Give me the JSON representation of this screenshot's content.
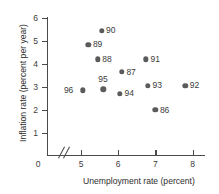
{
  "chart_data": {
    "type": "scatter",
    "title": "",
    "xlabel": "Unemployment rate (percent)",
    "ylabel": "Inflation rate (percent per year)",
    "xlim": [
      4.6,
      8.3
    ],
    "ylim": [
      0,
      6.4
    ],
    "xticks": [
      5,
      6,
      7,
      8
    ],
    "yticks": [
      1,
      2,
      3,
      4,
      5,
      6
    ],
    "xtick_labels": [
      "5",
      "6",
      "7",
      "8"
    ],
    "ytick_labels": [
      "1",
      "2",
      "3",
      "4",
      "5",
      "6"
    ],
    "origin_label": "0",
    "axis_break": true,
    "axis_break_symbol": "//",
    "grid": false,
    "legend": "none",
    "point_color": "#5b5b5b",
    "axis_color": "#4a4a4a",
    "points": [
      {
        "label": "90",
        "x": 5.55,
        "y": 5.45,
        "label_pos": "right"
      },
      {
        "label": "89",
        "x": 5.2,
        "y": 4.85,
        "label_pos": "right"
      },
      {
        "label": "88",
        "x": 5.45,
        "y": 4.2,
        "label_pos": "right"
      },
      {
        "label": "91",
        "x": 6.75,
        "y": 4.2,
        "label_pos": "right"
      },
      {
        "label": "87",
        "x": 6.1,
        "y": 3.65,
        "label_pos": "right"
      },
      {
        "label": "95",
        "x": 5.6,
        "y": 2.9,
        "label_pos": "above"
      },
      {
        "label": "96",
        "x": 5.05,
        "y": 2.85,
        "label_pos": "left"
      },
      {
        "label": "93",
        "x": 6.8,
        "y": 3.05,
        "label_pos": "right"
      },
      {
        "label": "92",
        "x": 7.8,
        "y": 3.05,
        "label_pos": "right"
      },
      {
        "label": "94",
        "x": 6.05,
        "y": 2.7,
        "label_pos": "right"
      },
      {
        "label": "86",
        "x": 7.0,
        "y": 2.0,
        "label_pos": "right"
      }
    ]
  }
}
